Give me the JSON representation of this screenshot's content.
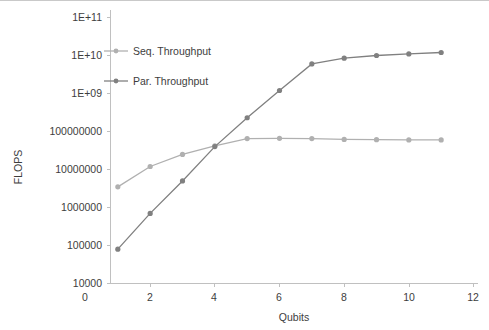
{
  "chart_data": {
    "type": "line",
    "title": "",
    "xlabel": "Qubits",
    "ylabel": "FLOPS",
    "xlim": [
      0,
      12
    ],
    "ylim": [
      10000,
      100000000000
    ],
    "yscale": "log",
    "grid": false,
    "legend_position": "upper-left-inside",
    "x_ticks": [
      "0",
      "2",
      "4",
      "6",
      "8",
      "10",
      "12"
    ],
    "x_tick_values": [
      0,
      2,
      4,
      6,
      8,
      10,
      12
    ],
    "y_ticks": [
      "1E+11",
      "1E+10",
      "1E+09",
      "100000000",
      "10000000",
      "1000000",
      "100000",
      "10000"
    ],
    "y_tick_values": [
      100000000000,
      10000000000,
      1000000000,
      100000000,
      10000000,
      1000000,
      100000,
      10000
    ],
    "x": [
      1,
      2,
      3,
      4,
      5,
      6,
      7,
      8,
      9,
      10,
      11
    ],
    "series": [
      {
        "name": "Seq. Throughput",
        "color": "#b0b0b0",
        "marker": "circle",
        "values": [
          3500000,
          12000000,
          25000000,
          42000000,
          65000000,
          66000000,
          65000000,
          62000000,
          61000000,
          60000000,
          60000000
        ]
      },
      {
        "name": "Par. Throughput",
        "color": "#808080",
        "marker": "circle",
        "values": [
          80000,
          700000,
          5000000,
          40000000,
          230000000,
          1200000000,
          6000000000,
          8500000000,
          10000000000,
          11000000000,
          12000000000
        ]
      }
    ]
  },
  "axes": {
    "y_axis_title": "FLOPS",
    "x_axis_title": "Qubits"
  },
  "legend": {
    "items": [
      {
        "label": "Seq. Throughput",
        "color": "#b0b0b0"
      },
      {
        "label": "Par. Throughput",
        "color": "#808080"
      }
    ]
  }
}
